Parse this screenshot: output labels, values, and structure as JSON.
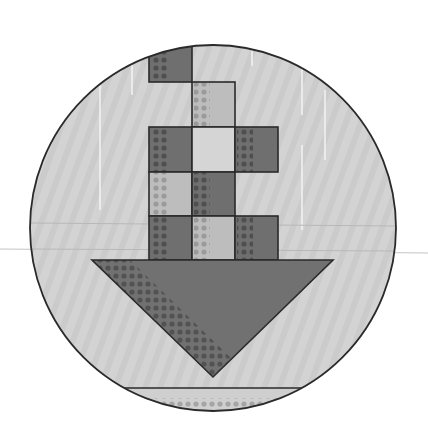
{
  "icon": {
    "name": "download-icon",
    "label": "Download",
    "colors": {
      "background": "#ffffff",
      "circle_fill": "#d3d3d3",
      "outline": "#2a2a2a",
      "dark_cell": "#6f6f6f",
      "light_cell": "#d5d5d5",
      "mid_cell": "#bdbdbd",
      "dot_dark": "#4f4f4f",
      "dot_light": "#9a9a9a",
      "arrow_fill": "#717171",
      "streak": "#f2f2f2",
      "guide_line": "#b8b8b8"
    },
    "circle": {
      "cx": 213,
      "cy": 228,
      "r": 183
    },
    "grid": {
      "columns_x": [
        149,
        192,
        235,
        278
      ],
      "rows_y": [
        38,
        82,
        127,
        172,
        216,
        260
      ],
      "cells": [
        {
          "row": 0,
          "col": 0,
          "tone": "dark"
        },
        {
          "row": 1,
          "col": 1,
          "tone": "mid"
        },
        {
          "row": 2,
          "col": 0,
          "tone": "dark"
        },
        {
          "row": 2,
          "col": 1,
          "tone": "light"
        },
        {
          "row": 2,
          "col": 2,
          "tone": "dark"
        },
        {
          "row": 3,
          "col": 0,
          "tone": "mid"
        },
        {
          "row": 3,
          "col": 1,
          "tone": "dark"
        },
        {
          "row": 4,
          "col": 0,
          "tone": "dark"
        },
        {
          "row": 4,
          "col": 1,
          "tone": "mid"
        },
        {
          "row": 4,
          "col": 2,
          "tone": "dark"
        }
      ]
    },
    "arrow": {
      "left_x": 92,
      "right_x": 333,
      "top_y": 260,
      "tip_x": 213,
      "tip_y": 377
    },
    "base_bar": {
      "y": 388,
      "left_x": 118,
      "right_x": 306
    },
    "guide_lines_y": [
      223,
      249
    ]
  }
}
